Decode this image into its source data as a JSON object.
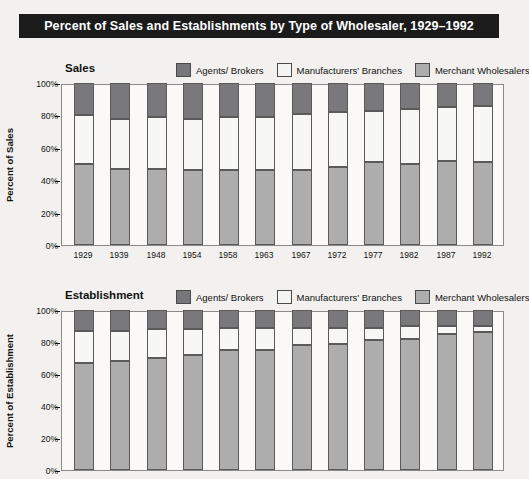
{
  "title": "Percent of Sales and Establishments by Type of Wholesaler, 1929–1992",
  "colors": {
    "title_bar_bg": "#1b1b1b",
    "title_text": "#ffffff",
    "page_bg": "#f2f1ef",
    "agents_brokers": "#79797c",
    "manufacturers_branches": "#f7f7f5",
    "merchant_wholesalers": "#adadad",
    "axis": "#8a8a8a"
  },
  "legend": {
    "items": [
      {
        "label": "Agents/ Brokers",
        "swatch": "agents-brokers-swatch"
      },
      {
        "label": "Manufacturers' Branches",
        "swatch": "manufacturers-branches-swatch"
      },
      {
        "label": "Merchant Wholesalers",
        "swatch": "merchant-wholesalers-swatch"
      }
    ]
  },
  "yticks": [
    "100%",
    "80%",
    "60%",
    "40%",
    "20%",
    "0%"
  ],
  "charts": [
    {
      "subtitle": "Sales",
      "ylabel": "Percent of Sales",
      "id": "sales"
    },
    {
      "subtitle": "Establishment",
      "ylabel": "Percent of Establishment",
      "id": "establishment"
    }
  ],
  "chart_data": [
    {
      "type": "bar",
      "title": "Sales",
      "subtitle": "Percent of Sales and Establishments by Type of Wholesaler, 1929–1992",
      "xlabel": "",
      "ylabel": "Percent of Sales",
      "ylim": [
        0,
        100
      ],
      "ytick_values": [
        0,
        20,
        40,
        60,
        80,
        100
      ],
      "ytick_labels": [
        "0%",
        "20%",
        "40%",
        "60%",
        "80%",
        "100%"
      ],
      "grid": false,
      "stacked": true,
      "legend_position": "top-right",
      "categories": [
        "1929",
        "1939",
        "1948",
        "1954",
        "1958",
        "1963",
        "1967",
        "1972",
        "1977",
        "1982",
        "1987",
        "1992"
      ],
      "series": [
        {
          "name": "Merchant Wholesalers",
          "values": [
            50,
            47,
            47,
            46,
            46,
            46,
            46,
            48,
            51,
            50,
            52,
            51
          ]
        },
        {
          "name": "Manufacturers' Branches",
          "values": [
            30,
            31,
            32,
            32,
            33,
            33,
            35,
            34,
            32,
            34,
            33,
            35
          ]
        },
        {
          "name": "Agents/ Brokers",
          "values": [
            20,
            22,
            21,
            22,
            21,
            21,
            19,
            18,
            17,
            16,
            15,
            14
          ]
        }
      ]
    },
    {
      "type": "bar",
      "title": "Establishment",
      "xlabel": "",
      "ylabel": "Percent of Establishment",
      "ylim": [
        0,
        100
      ],
      "ytick_values": [
        0,
        20,
        40,
        60,
        80,
        100
      ],
      "ytick_labels": [
        "0%",
        "20%",
        "40%",
        "60%",
        "80%",
        "100%"
      ],
      "grid": false,
      "stacked": true,
      "legend_position": "top-right",
      "categories": [
        "1929",
        "1939",
        "1948",
        "1954",
        "1958",
        "1963",
        "1967",
        "1972",
        "1977",
        "1982",
        "1987",
        "1992"
      ],
      "series": [
        {
          "name": "Merchant Wholesalers",
          "values": [
            67,
            68,
            70,
            72,
            75,
            75,
            78,
            79,
            81,
            82,
            85,
            86
          ]
        },
        {
          "name": "Manufacturers' Branches",
          "values": [
            20,
            19,
            18,
            16,
            14,
            14,
            11,
            10,
            8,
            8,
            5,
            4
          ]
        },
        {
          "name": "Agents/ Brokers",
          "values": [
            13,
            13,
            12,
            12,
            11,
            11,
            11,
            11,
            11,
            10,
            10,
            10
          ]
        }
      ]
    }
  ]
}
